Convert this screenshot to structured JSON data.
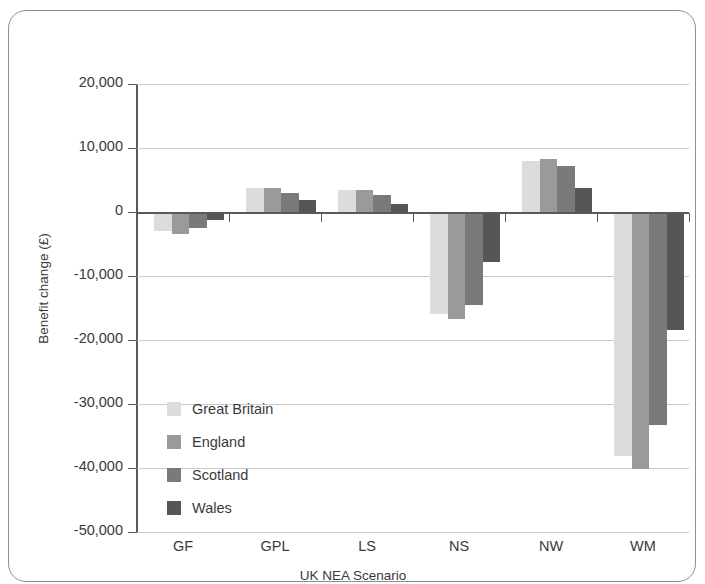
{
  "chart_data": {
    "type": "bar",
    "title": "",
    "xlabel": "UK NEA Scenario",
    "ylabel": "Benefit change (£)",
    "categories": [
      "GF",
      "GPL",
      "LS",
      "NS",
      "NW",
      "WM"
    ],
    "ylim": [
      -50000,
      20000
    ],
    "yticks": [
      20000,
      10000,
      0,
      -10000,
      -20000,
      -30000,
      -40000,
      -50000
    ],
    "ytick_labels": [
      "20,000",
      "10,000",
      "0",
      "-10,000",
      "-20,000",
      "-30,000",
      "-40,000",
      "-50,000"
    ],
    "grid": true,
    "legend_position": "inside-lower-left",
    "series": [
      {
        "name": "Great Britain",
        "color": "#dcdcdc",
        "values": [
          -3000,
          3800,
          3400,
          -16000,
          7900,
          -38200
        ]
      },
      {
        "name": "England",
        "color": "#9a9a9a",
        "values": [
          -3500,
          3800,
          3400,
          -16700,
          8300,
          -40200
        ]
      },
      {
        "name": "Scotland",
        "color": "#7a7a7a",
        "values": [
          -2500,
          3000,
          2600,
          -14500,
          7200,
          -33300
        ]
      },
      {
        "name": "Wales",
        "color": "#565656",
        "values": [
          -1200,
          1800,
          1300,
          -7800,
          3700,
          -18500
        ]
      }
    ]
  },
  "axes": {
    "x_title": "UK NEA Scenario",
    "y_title": "Benefit change (£)"
  },
  "legend": {
    "items": [
      {
        "label": "Great Britain",
        "color": "#dcdcdc"
      },
      {
        "label": "England",
        "color": "#9a9a9a"
      },
      {
        "label": "Scotland",
        "color": "#7a7a7a"
      },
      {
        "label": "Wales",
        "color": "#565656"
      }
    ]
  },
  "colors": {
    "frame": "#8d8f92",
    "axis": "#58595b",
    "grid": "#c9c9c9",
    "text": "#3a3a3a"
  }
}
